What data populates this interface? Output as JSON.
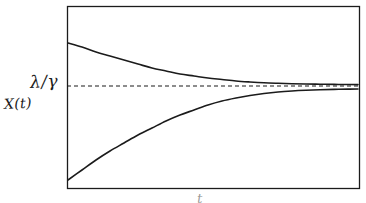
{
  "figure": {
    "kind": "hand-drawn-plot",
    "background_color": "#ffffff",
    "ink_color": "#1b1b1b",
    "frame": {
      "x": 67,
      "y": 6,
      "width": 292,
      "height": 182,
      "stroke_width": 1.3
    }
  },
  "labels": {
    "threshold": "λ/γ",
    "variable": "X(t)",
    "time_axis": "t"
  },
  "chart_data": {
    "type": "line",
    "title": "",
    "xlabel": "t",
    "ylabel": "X(t)",
    "grid": false,
    "legend": null,
    "axis_ticks": {
      "x": [],
      "y": [
        "λ/γ"
      ]
    },
    "xlim": [
      0,
      1
    ],
    "ylim": [
      0,
      1
    ],
    "annotations": [
      {
        "text": "λ/γ",
        "role": "y-axis-tick-label",
        "x_px": 32,
        "y_px": 80
      },
      {
        "text": "X(t)",
        "role": "y-axis-title",
        "x_px": 6,
        "y_px": 103
      },
      {
        "text": "t",
        "role": "x-axis-title",
        "x_px": 200,
        "y_px": 196
      }
    ],
    "asymptote": {
      "name": "λ/γ",
      "style": "dashed",
      "y_px": 86,
      "x_start_px": 67,
      "x_end_px": 359,
      "dash_pattern": "4 3"
    },
    "series": [
      {
        "name": "upper-trajectory",
        "style": "solid",
        "description": "decays from above toward the λ/γ asymptote",
        "points_px": [
          [
            68,
            43
          ],
          [
            82,
            47
          ],
          [
            96,
            52
          ],
          [
            110,
            56
          ],
          [
            124,
            60
          ],
          [
            138,
            64
          ],
          [
            152,
            68
          ],
          [
            166,
            71
          ],
          [
            180,
            74
          ],
          [
            194,
            76
          ],
          [
            208,
            78
          ],
          [
            222,
            79.5
          ],
          [
            236,
            81
          ],
          [
            250,
            82
          ],
          [
            264,
            82.8
          ],
          [
            278,
            83.3
          ],
          [
            292,
            83.7
          ],
          [
            306,
            84
          ],
          [
            320,
            84.2
          ],
          [
            334,
            84.4
          ],
          [
            348,
            84.5
          ],
          [
            358,
            84.6
          ]
        ]
      },
      {
        "name": "lower-trajectory",
        "style": "solid",
        "description": "rises from below toward the λ/γ asymptote",
        "points_px": [
          [
            68,
            180
          ],
          [
            82,
            170
          ],
          [
            96,
            160
          ],
          [
            110,
            151
          ],
          [
            124,
            143
          ],
          [
            138,
            135
          ],
          [
            152,
            128
          ],
          [
            166,
            121
          ],
          [
            180,
            115
          ],
          [
            194,
            110
          ],
          [
            208,
            105
          ],
          [
            222,
            101
          ],
          [
            236,
            98
          ],
          [
            250,
            95.5
          ],
          [
            264,
            93.5
          ],
          [
            278,
            92
          ],
          [
            292,
            91
          ],
          [
            306,
            90.3
          ],
          [
            320,
            89.8
          ],
          [
            334,
            89.4
          ],
          [
            348,
            89.1
          ],
          [
            358,
            89
          ]
        ]
      }
    ]
  }
}
